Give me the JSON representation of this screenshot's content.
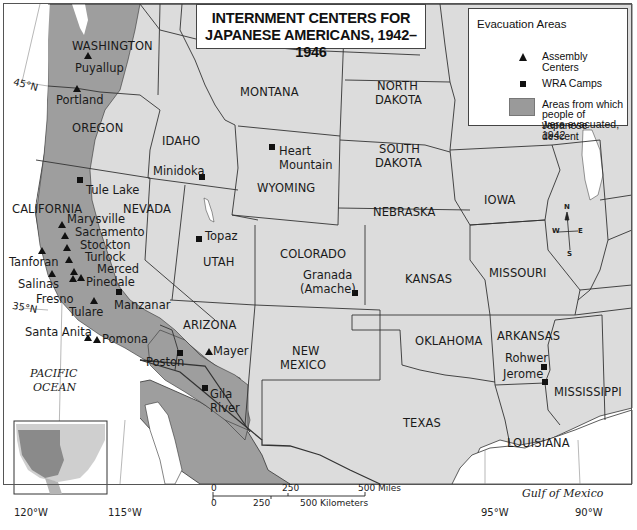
{
  "title": {
    "line1": "INTERNMENT CENTERS FOR",
    "line2": "JAPANESE AMERICANS, 1942–1946"
  },
  "legend": {
    "heading": "Evacuation Areas",
    "items": [
      {
        "symbol": "triangle",
        "label": "Assembly Centers"
      },
      {
        "symbol": "square",
        "label": "WRA Camps"
      },
      {
        "symbol": "shaded-area",
        "label_lines": [
          "Areas from which",
          "people of Japanese descent",
          "were evacuated, 1942"
        ]
      }
    ]
  },
  "colors": {
    "land": "#dcdcdc",
    "evacuation_area": "#9e9e9e",
    "water": "#ffffff",
    "border": "#333333",
    "marker": "#111111"
  },
  "states": {
    "washington": "WASHINGTON",
    "oregon": "OREGON",
    "california": "CALIFORNIA",
    "nevada": "NEVADA",
    "idaho": "IDAHO",
    "montana": "MONTANA",
    "wyoming": "WYOMING",
    "utah": "UTAH",
    "arizona": "ARIZONA",
    "colorado": "COLORADO",
    "new_mexico_1": "NEW",
    "new_mexico_2": "MEXICO",
    "north_dakota_1": "NORTH",
    "north_dakota_2": "DAKOTA",
    "south_dakota_1": "SOUTH",
    "south_dakota_2": "DAKOTA",
    "nebraska": "NEBRASKA",
    "kansas": "KANSAS",
    "oklahoma": "OKLAHOMA",
    "texas": "TEXAS",
    "iowa": "IOWA",
    "missouri": "MISSOURI",
    "arkansas": "ARKANSAS",
    "louisiana": "LOUISIANA",
    "mississippi": "MISSISSIPPI"
  },
  "assembly_centers": [
    {
      "name": "Puyallup"
    },
    {
      "name": "Portland"
    },
    {
      "name": "Marysville"
    },
    {
      "name": "Sacramento"
    },
    {
      "name": "Stockton"
    },
    {
      "name": "Turlock"
    },
    {
      "name": "Merced"
    },
    {
      "name": "Pinedale"
    },
    {
      "name": "Tanforan"
    },
    {
      "name": "Salinas"
    },
    {
      "name": "Fresno"
    },
    {
      "name": "Tulare"
    },
    {
      "name": "Santa Anita"
    },
    {
      "name": "Pomona"
    },
    {
      "name": "Mayer"
    }
  ],
  "wra_camps": [
    {
      "name": "Tule Lake"
    },
    {
      "name": "Minidoka"
    },
    {
      "name": "Heart Mountain",
      "lines": [
        "Heart",
        "Mountain"
      ]
    },
    {
      "name": "Topaz"
    },
    {
      "name": "Manzanar"
    },
    {
      "name": "Granada (Amache)",
      "lines": [
        "Granada",
        "(Amache)"
      ]
    },
    {
      "name": "Poston"
    },
    {
      "name": "Gila River",
      "lines": [
        "Gila",
        "River"
      ]
    },
    {
      "name": "Rohwer"
    },
    {
      "name": "Jerome"
    }
  ],
  "water_labels": {
    "pacific_1": "PACIFIC",
    "pacific_2": "OCEAN",
    "gulf": "Gulf of Mexico"
  },
  "coordinates": {
    "lat45": "45°N",
    "lat35": "35°N",
    "lon120": "120°W",
    "lon115": "115°W",
    "lon95": "95°W",
    "lon90": "90°W"
  },
  "scale_bar": {
    "miles": [
      "0",
      "250",
      "500 Miles"
    ],
    "kilometers": [
      "0",
      "250",
      "500 Kilometers"
    ]
  },
  "compass": {
    "n": "N",
    "s": "S",
    "e": "E",
    "w": "W"
  }
}
